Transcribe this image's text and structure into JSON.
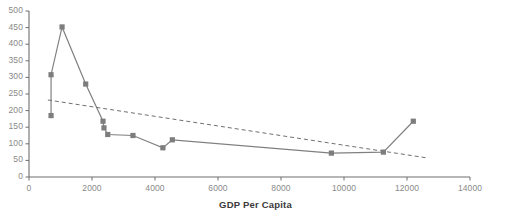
{
  "chart_data": {
    "type": "line",
    "title": "",
    "xlabel": "GDP Per Capita",
    "ylabel": "",
    "xlim": [
      0,
      14000
    ],
    "ylim": [
      0,
      500
    ],
    "grid": false,
    "legend": "none",
    "xticks": [
      0,
      2000,
      4000,
      6000,
      8000,
      10000,
      12000,
      14000
    ],
    "xtick_labels": [
      "0",
      "2000",
      "4000",
      "6000",
      "8000",
      "10000",
      "12000",
      "14000"
    ],
    "yticks": [
      0,
      50,
      100,
      150,
      200,
      250,
      300,
      350,
      400,
      450,
      500
    ],
    "ytick_labels": [
      "0",
      "50",
      "100",
      "150",
      "200",
      "250",
      "300",
      "350",
      "400",
      "450",
      "500"
    ],
    "series": [
      {
        "name": "data",
        "style": "solid-with-square-markers",
        "color": "#808080",
        "points": [
          [
            700,
            185
          ],
          [
            700,
            308
          ],
          [
            1050,
            452
          ],
          [
            1800,
            280
          ],
          [
            2350,
            168
          ],
          [
            2380,
            148
          ],
          [
            2500,
            128
          ],
          [
            3300,
            125
          ],
          [
            4250,
            88
          ],
          [
            4550,
            112
          ],
          [
            9600,
            72
          ],
          [
            11250,
            75
          ],
          [
            12200,
            168
          ]
        ]
      },
      {
        "name": "trendline",
        "style": "dashed",
        "color": "#707070",
        "points": [
          [
            600,
            232
          ],
          [
            12600,
            58
          ]
        ]
      }
    ]
  },
  "axis_colors": {
    "axis_line": "#6e6e6e",
    "tick_text": "#8a8a8a",
    "title_text": "#3a3a3a",
    "series_line": "#808080",
    "marker_fill": "#7d7d7d",
    "trend_line": "#707070"
  }
}
